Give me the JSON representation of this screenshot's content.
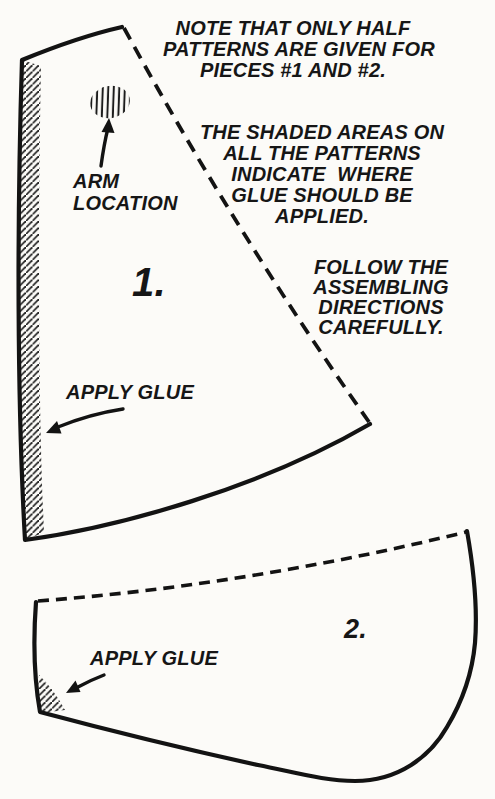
{
  "page": {
    "type": "craft-pattern-instruction-diagram",
    "paper_color": "#fcfbf8",
    "ink_color": "#161616"
  },
  "notes": {
    "half_pattern_note": {
      "lines": [
        "NOTE THAT ONLY HALF",
        "PATTERNS ARE GIVEN FOR",
        "PIECES #1 AND #2."
      ]
    },
    "shaded_areas_note": {
      "lines": [
        "THE SHADED AREAS ON",
        "ALL THE PATTERNS",
        "INDICATE  WHERE",
        "GLUE SHOULD BE",
        "APPLIED."
      ]
    },
    "directions_note": {
      "lines": [
        "FOLLOW THE",
        "ASSEMBLING",
        "DIRECTIONS",
        "CAREFULLY."
      ]
    }
  },
  "piece1": {
    "number_label": "1.",
    "arm_label_lines": [
      "ARM",
      "LOCATION"
    ],
    "glue_label": "APPLY GLUE",
    "features": [
      "fold-line-dashed",
      "glue-strip-hatched-left-edge",
      "arm-location-hatched-spot"
    ]
  },
  "piece2": {
    "number_label": "2.",
    "glue_label": "APPLY GLUE",
    "features": [
      "fold-line-dashed-top-edge",
      "glue-corner-hatched-bottom-left"
    ]
  }
}
